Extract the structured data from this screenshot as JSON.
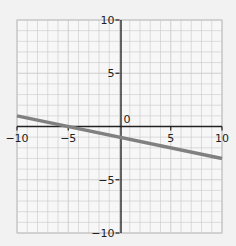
{
  "chart_data": {
    "type": "line",
    "title": "",
    "xlabel": "",
    "ylabel": "",
    "xlim": [
      -10,
      10
    ],
    "ylim": [
      -10,
      10
    ],
    "grid": true,
    "x_ticks": [
      -10,
      -5,
      0,
      5,
      10
    ],
    "y_ticks": [
      -10,
      -5,
      5,
      10
    ],
    "x_tick_labels": [
      "−10",
      "−5",
      "5",
      "10"
    ],
    "y_tick_labels": [
      "10",
      "5",
      "−5",
      "−10"
    ],
    "origin_label": "0",
    "series": [
      {
        "name": "line",
        "equation": "y = -0.2x - 1",
        "x": [
          -10,
          10
        ],
        "y": [
          1,
          -3
        ],
        "color": "#808080"
      }
    ]
  },
  "colors": {
    "background": "#f2f2f2",
    "plot_background": "#f7f7f7",
    "grid": "#c8c8c8",
    "axis": "#222222",
    "line": "#808080"
  }
}
